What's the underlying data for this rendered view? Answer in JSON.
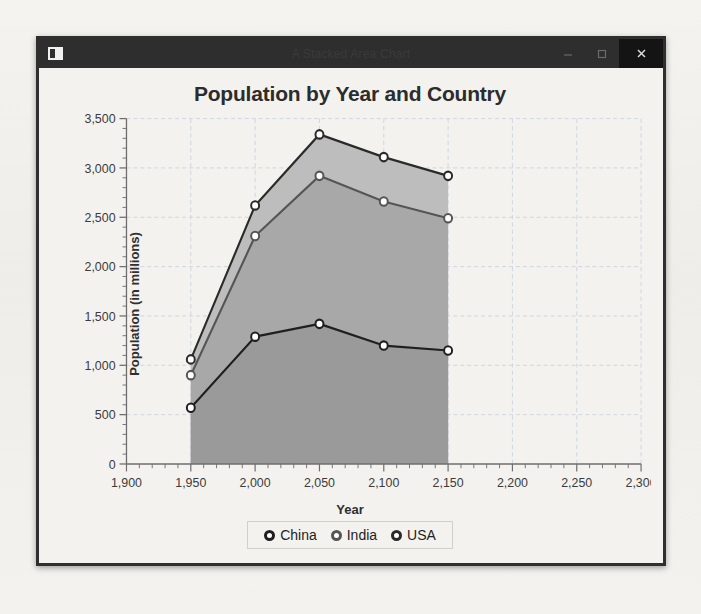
{
  "window": {
    "title": "A Stacked Area Chart",
    "icon": "app-window-icon",
    "controls": {
      "minimize": "–",
      "maximize": "□",
      "close": "×"
    }
  },
  "chart_data": {
    "type": "area",
    "stacked": true,
    "title": "Population by Year and Country",
    "xlabel": "Year",
    "ylabel": "Population (in millions)",
    "x": [
      1950,
      2000,
      2050,
      2100,
      2150
    ],
    "xlim": [
      1900,
      2300
    ],
    "ylim": [
      0,
      3500
    ],
    "xticks": [
      "1,900",
      "1,950",
      "2,000",
      "2,050",
      "2,100",
      "2,150",
      "2,200",
      "2,250",
      "2,300"
    ],
    "xtick_values": [
      1900,
      1950,
      2000,
      2050,
      2100,
      2150,
      2200,
      2250,
      2300
    ],
    "yticks": [
      "0",
      "500",
      "1,000",
      "1,500",
      "2,000",
      "2,500",
      "3,000",
      "3,500"
    ],
    "ytick_values": [
      0,
      500,
      1000,
      1500,
      2000,
      2500,
      3000,
      3500
    ],
    "grid": true,
    "legend_position": "bottom",
    "series": [
      {
        "name": "China",
        "color": "#9a9a9a",
        "line_color": "#1f1f1f",
        "values": [
          570,
          1290,
          1420,
          1200,
          1150
        ],
        "cumulative": [
          570,
          1290,
          1420,
          1200,
          1150
        ]
      },
      {
        "name": "India",
        "color": "#a8a8a8",
        "line_color": "#555555",
        "values": [
          330,
          1020,
          1500,
          1460,
          1340
        ],
        "cumulative": [
          900,
          2310,
          2920,
          2660,
          2490
        ]
      },
      {
        "name": "USA",
        "color": "#bdbdbd",
        "line_color": "#2a2a2a",
        "values": [
          160,
          310,
          420,
          450,
          430
        ],
        "cumulative": [
          1060,
          2620,
          3340,
          3110,
          2920
        ]
      }
    ]
  },
  "legend": {
    "items": [
      {
        "label": "China",
        "marker": "circle-marker"
      },
      {
        "label": "India",
        "marker": "circle-marker"
      },
      {
        "label": "USA",
        "marker": "circle-marker"
      }
    ]
  }
}
